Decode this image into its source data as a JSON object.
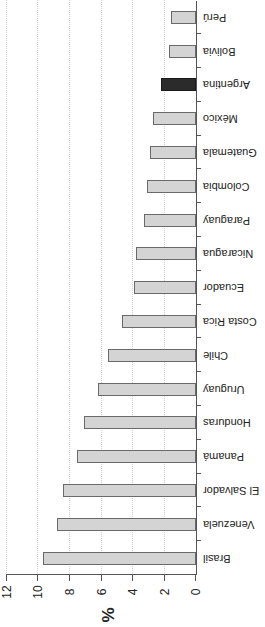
{
  "chart_data": {
    "type": "bar",
    "orientation": "horizontal",
    "rendered_rotation_deg": 180,
    "title": "",
    "xlabel": "%",
    "ylabel": "",
    "xlim": [
      0,
      12
    ],
    "xticks": [
      "0",
      "2",
      "4",
      "6",
      "8",
      "10",
      "12"
    ],
    "grid": {
      "vertical": true,
      "style": "dotted"
    },
    "legend": null,
    "categories": [
      "Brasil",
      "Venezuela",
      "El Salvador",
      "Panamá",
      "Honduras",
      "Uruguay",
      "Chile",
      "Costa Rica",
      "Ecuador",
      "Nicaragua",
      "Paraguay",
      "Colombia",
      "Guatemala",
      "México",
      "Argentina",
      "Bolivia",
      "Perú"
    ],
    "values": [
      9.7,
      8.8,
      8.4,
      7.5,
      7.1,
      6.2,
      5.6,
      4.7,
      3.9,
      3.8,
      3.3,
      3.1,
      2.9,
      2.7,
      2.2,
      1.7,
      1.6
    ],
    "highlight": "Argentina",
    "colors": {
      "bar": "#d4d4d4",
      "bar_border": "#6a6a6a",
      "highlight": "#2b2b2b"
    }
  }
}
